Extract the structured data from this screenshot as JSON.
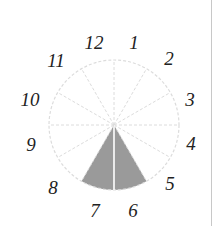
{
  "diagram": {
    "type": "clock-wheel",
    "center": [
      114,
      125
    ],
    "radius": 65,
    "segments": 12,
    "shaded_sector": {
      "from_label": "6",
      "to_label": "7",
      "start_deg": 150,
      "end_deg": 210
    },
    "colors": {
      "shade": "#9a9a9a",
      "circle": "#dcdcdc",
      "spoke": "#dcdcdc",
      "text": "#222222",
      "divider": "#c8c8c8"
    },
    "labels": [
      {
        "text": "12",
        "x": 94,
        "y": 49
      },
      {
        "text": "1",
        "x": 134,
        "y": 49
      },
      {
        "text": "2",
        "x": 169,
        "y": 65
      },
      {
        "text": "3",
        "x": 190,
        "y": 106
      },
      {
        "text": "4",
        "x": 191,
        "y": 150
      },
      {
        "text": "5",
        "x": 170,
        "y": 190
      },
      {
        "text": "6",
        "x": 133,
        "y": 217
      },
      {
        "text": "7",
        "x": 95,
        "y": 217
      },
      {
        "text": "8",
        "x": 53,
        "y": 194
      },
      {
        "text": "9",
        "x": 31,
        "y": 151
      },
      {
        "text": "10",
        "x": 30,
        "y": 106
      },
      {
        "text": "11",
        "x": 56,
        "y": 67
      }
    ]
  }
}
